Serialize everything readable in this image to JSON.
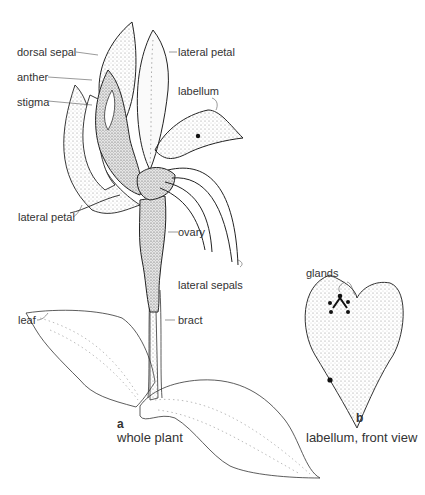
{
  "figure": {
    "panels": [
      {
        "letter": "a",
        "caption": "whole plant",
        "labels": {
          "dorsal_sepal": "dorsal sepal",
          "anther": "anther",
          "stigma": "stigma",
          "lateral_petal_top": "lateral petal",
          "labellum": "labellum",
          "lateral_petal_left": "lateral petal",
          "ovary": "ovary",
          "lateral_sepals": "lateral sepals",
          "leaf": "leaf",
          "bract": "bract"
        }
      },
      {
        "letter": "b",
        "caption": "labellum, front view",
        "labels": {
          "glands": "glands"
        }
      }
    ]
  }
}
